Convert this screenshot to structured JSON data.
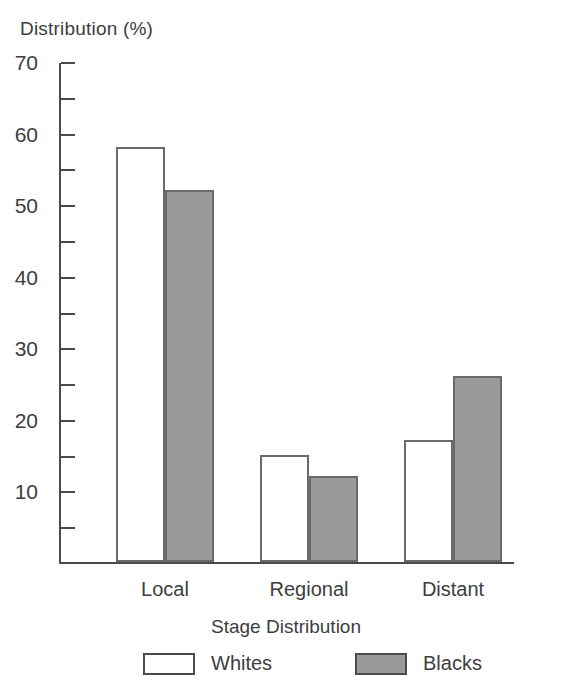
{
  "chart_data": {
    "type": "bar",
    "title": "",
    "ylabel": "Distribution (%)",
    "xlabel": "Stage Distribution",
    "categories": [
      "Local",
      "Regional",
      "Distant"
    ],
    "series": [
      {
        "name": "Whites",
        "values": [
          58,
          15,
          17
        ],
        "color": "#ffffff"
      },
      {
        "name": "Blacks",
        "values": [
          52,
          12,
          26
        ],
        "color": "#9a9a9a"
      }
    ],
    "ylim": [
      0,
      70
    ],
    "y_major_ticks": [
      70,
      60,
      50,
      40,
      30,
      20,
      10
    ],
    "y_minor_ticks": [
      65,
      55,
      45,
      35,
      25,
      15,
      5
    ],
    "y_tick_labels": [
      "70",
      "60",
      "50",
      "40",
      "30",
      "20",
      "10"
    ],
    "grid": false,
    "legend": {
      "position": "bottom",
      "entries": [
        {
          "label": "Whites",
          "swatch": "white-swatch"
        },
        {
          "label": "Blacks",
          "swatch": "gray-swatch"
        }
      ]
    },
    "axis_color": "#4a4a4a",
    "bar_outline_color": "#6a6a6a",
    "text_color": "#3d3d3d",
    "background": "#ffffff"
  }
}
